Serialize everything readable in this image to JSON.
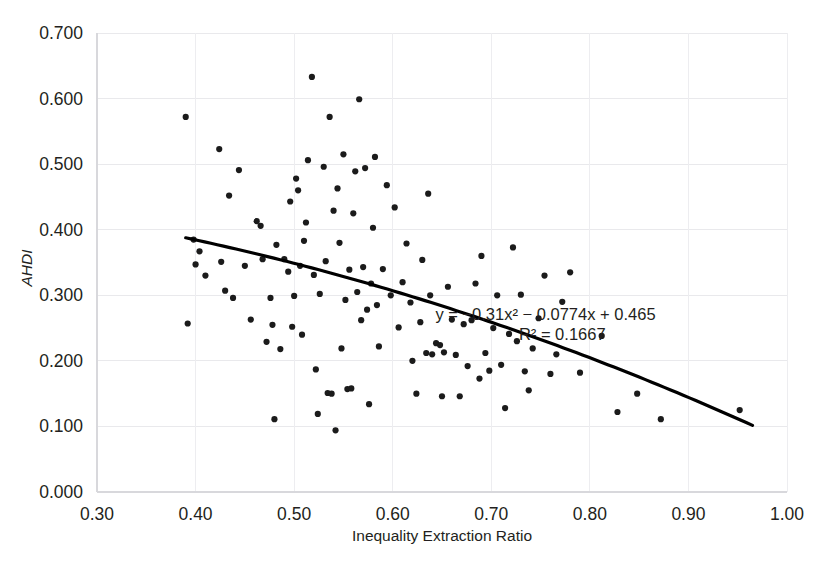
{
  "chart_data": {
    "type": "scatter",
    "title": "",
    "xlabel": "Inequality Extraction Ratio",
    "ylabel": "AHDI",
    "xlim": [
      0.3,
      1.0
    ],
    "ylim": [
      0.0,
      0.7
    ],
    "xticks": [
      "0.30",
      "0.40",
      "0.50",
      "0.60",
      "0.70",
      "0.80",
      "0.90",
      "1.00"
    ],
    "xtick_values": [
      0.3,
      0.4,
      0.5,
      0.6,
      0.7,
      0.8,
      0.9,
      1.0
    ],
    "yticks": [
      "0.000",
      "0.100",
      "0.200",
      "0.300",
      "0.400",
      "0.500",
      "0.600",
      "0.700"
    ],
    "ytick_values": [
      0.0,
      0.1,
      0.2,
      0.3,
      0.4,
      0.5,
      0.6,
      0.7
    ],
    "grid": true,
    "legend": false,
    "marker_color": "#1b1b1b",
    "trendline_color": "#000000",
    "annotations": [
      {
        "name": "regression-equation",
        "text": "y = −0.31x² − 0.0774x + 0.465",
        "x": 0.755,
        "y": 0.262
      },
      {
        "name": "r-squared",
        "text": "R² = 0.1667",
        "x": 0.772,
        "y": 0.232
      }
    ],
    "trendline": {
      "type": "polynomial",
      "degree": 2,
      "equation": "y = -0.31x^2 - 0.0774x + 0.465",
      "coefficients": {
        "a": -0.31,
        "b": -0.0774,
        "c": 0.465
      },
      "r_squared": 0.1667,
      "x_start": 0.39,
      "x_end": 0.965
    },
    "points": [
      [
        0.39,
        0.572
      ],
      [
        0.392,
        0.257
      ],
      [
        0.398,
        0.385
      ],
      [
        0.4,
        0.347
      ],
      [
        0.404,
        0.367
      ],
      [
        0.41,
        0.33
      ],
      [
        0.424,
        0.523
      ],
      [
        0.426,
        0.351
      ],
      [
        0.43,
        0.307
      ],
      [
        0.434,
        0.452
      ],
      [
        0.438,
        0.296
      ],
      [
        0.444,
        0.491
      ],
      [
        0.45,
        0.345
      ],
      [
        0.456,
        0.263
      ],
      [
        0.462,
        0.413
      ],
      [
        0.466,
        0.406
      ],
      [
        0.468,
        0.355
      ],
      [
        0.472,
        0.229
      ],
      [
        0.476,
        0.296
      ],
      [
        0.478,
        0.255
      ],
      [
        0.48,
        0.111
      ],
      [
        0.482,
        0.377
      ],
      [
        0.486,
        0.218
      ],
      [
        0.49,
        0.355
      ],
      [
        0.494,
        0.336
      ],
      [
        0.496,
        0.443
      ],
      [
        0.498,
        0.252
      ],
      [
        0.5,
        0.299
      ],
      [
        0.502,
        0.478
      ],
      [
        0.504,
        0.46
      ],
      [
        0.506,
        0.345
      ],
      [
        0.508,
        0.24
      ],
      [
        0.51,
        0.383
      ],
      [
        0.512,
        0.411
      ],
      [
        0.514,
        0.506
      ],
      [
        0.518,
        0.633
      ],
      [
        0.52,
        0.331
      ],
      [
        0.522,
        0.187
      ],
      [
        0.524,
        0.119
      ],
      [
        0.526,
        0.302
      ],
      [
        0.53,
        0.496
      ],
      [
        0.532,
        0.352
      ],
      [
        0.534,
        0.151
      ],
      [
        0.536,
        0.572
      ],
      [
        0.538,
        0.15
      ],
      [
        0.54,
        0.429
      ],
      [
        0.542,
        0.094
      ],
      [
        0.544,
        0.463
      ],
      [
        0.546,
        0.38
      ],
      [
        0.548,
        0.219
      ],
      [
        0.55,
        0.515
      ],
      [
        0.552,
        0.293
      ],
      [
        0.554,
        0.157
      ],
      [
        0.556,
        0.339
      ],
      [
        0.558,
        0.158
      ],
      [
        0.56,
        0.425
      ],
      [
        0.562,
        0.489
      ],
      [
        0.564,
        0.305
      ],
      [
        0.566,
        0.599
      ],
      [
        0.568,
        0.262
      ],
      [
        0.57,
        0.343
      ],
      [
        0.572,
        0.494
      ],
      [
        0.574,
        0.278
      ],
      [
        0.576,
        0.134
      ],
      [
        0.578,
        0.318
      ],
      [
        0.58,
        0.403
      ],
      [
        0.582,
        0.511
      ],
      [
        0.584,
        0.285
      ],
      [
        0.586,
        0.222
      ],
      [
        0.59,
        0.34
      ],
      [
        0.594,
        0.468
      ],
      [
        0.598,
        0.3
      ],
      [
        0.602,
        0.434
      ],
      [
        0.606,
        0.251
      ],
      [
        0.61,
        0.32
      ],
      [
        0.614,
        0.379
      ],
      [
        0.618,
        0.289
      ],
      [
        0.62,
        0.2
      ],
      [
        0.624,
        0.15
      ],
      [
        0.628,
        0.259
      ],
      [
        0.63,
        0.354
      ],
      [
        0.634,
        0.212
      ],
      [
        0.636,
        0.455
      ],
      [
        0.638,
        0.3
      ],
      [
        0.64,
        0.21
      ],
      [
        0.644,
        0.227
      ],
      [
        0.648,
        0.224
      ],
      [
        0.65,
        0.146
      ],
      [
        0.652,
        0.213
      ],
      [
        0.656,
        0.313
      ],
      [
        0.66,
        0.263
      ],
      [
        0.664,
        0.209
      ],
      [
        0.668,
        0.146
      ],
      [
        0.672,
        0.256
      ],
      [
        0.676,
        0.192
      ],
      [
        0.68,
        0.262
      ],
      [
        0.684,
        0.318
      ],
      [
        0.688,
        0.173
      ],
      [
        0.69,
        0.36
      ],
      [
        0.694,
        0.212
      ],
      [
        0.698,
        0.185
      ],
      [
        0.702,
        0.25
      ],
      [
        0.706,
        0.3
      ],
      [
        0.71,
        0.194
      ],
      [
        0.714,
        0.128
      ],
      [
        0.718,
        0.241
      ],
      [
        0.722,
        0.373
      ],
      [
        0.726,
        0.23
      ],
      [
        0.73,
        0.301
      ],
      [
        0.734,
        0.184
      ],
      [
        0.738,
        0.155
      ],
      [
        0.742,
        0.219
      ],
      [
        0.748,
        0.265
      ],
      [
        0.754,
        0.33
      ],
      [
        0.76,
        0.18
      ],
      [
        0.766,
        0.21
      ],
      [
        0.772,
        0.29
      ],
      [
        0.78,
        0.335
      ],
      [
        0.79,
        0.182
      ],
      [
        0.812,
        0.238
      ],
      [
        0.828,
        0.122
      ],
      [
        0.848,
        0.15
      ],
      [
        0.872,
        0.111
      ],
      [
        0.952,
        0.125
      ]
    ]
  }
}
